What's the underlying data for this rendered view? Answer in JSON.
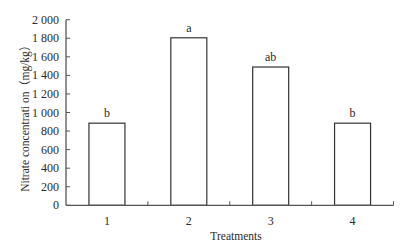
{
  "chart_data": {
    "type": "bar",
    "title": "",
    "xlabel": "Treatments",
    "ylabel": "Nitrate concentrati on（mg/kg）",
    "categories": [
      "1",
      "2",
      "3",
      "4"
    ],
    "values": [
      885,
      1805,
      1490,
      885
    ],
    "significance_letters": [
      "b",
      "a",
      "ab",
      "b"
    ],
    "ylim": [
      0,
      2000
    ],
    "yticks": [
      0,
      200,
      400,
      600,
      800,
      1000,
      1200,
      1400,
      1600,
      1800,
      2000
    ],
    "ytick_labels": [
      "0",
      "200",
      "400",
      "600",
      "800",
      "1 000",
      "1 200",
      "1 400",
      "1 600",
      "1 800",
      "2 000"
    ],
    "grid": false,
    "legend": null,
    "colors": {
      "bar_fill": "#ffffff",
      "bar_stroke": "#333333",
      "axis": "#555555"
    }
  }
}
